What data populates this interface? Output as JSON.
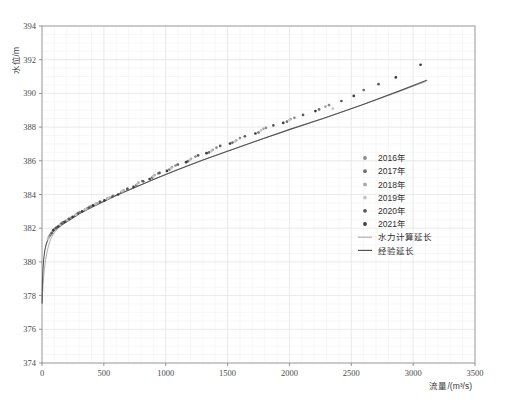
{
  "chart_data": {
    "type": "scatter",
    "title": "",
    "xlabel": "流量/(m³/s)",
    "ylabel": "水位/m",
    "xlim": [
      0,
      3500
    ],
    "ylim": [
      374,
      394
    ],
    "xticks": [
      0,
      500,
      1000,
      1500,
      2000,
      2500,
      3000,
      3500
    ],
    "yticks": [
      374,
      376,
      378,
      380,
      382,
      384,
      386,
      388,
      390,
      392,
      394
    ],
    "xtick_labels": [
      "0",
      "500",
      "1000",
      "1500",
      "2000",
      "2500",
      "3000",
      "3500"
    ],
    "ytick_labels": [
      "374",
      "376",
      "378",
      "380",
      "382",
      "384",
      "386",
      "388",
      "390",
      "392",
      "394"
    ],
    "x_minor_step": 100,
    "y_minor_step": 0.5,
    "grid": true,
    "grid_color": "#e2e2e2",
    "legend_position": "center-right",
    "series": [
      {
        "name": "2016年",
        "marker": "circle",
        "color": "#8c8c8c",
        "points": [
          [
            62,
            381.55
          ],
          [
            88,
            381.85
          ],
          [
            120,
            382.05
          ],
          [
            168,
            382.35
          ],
          [
            236,
            382.62
          ],
          [
            305,
            382.95
          ],
          [
            392,
            383.3
          ],
          [
            470,
            383.58
          ],
          [
            575,
            383.92
          ],
          [
            690,
            384.35
          ],
          [
            810,
            384.8
          ],
          [
            940,
            385.25
          ],
          [
            1080,
            385.72
          ],
          [
            1240,
            386.25
          ],
          [
            1410,
            386.78
          ],
          [
            1600,
            387.35
          ],
          [
            1810,
            387.95
          ],
          [
            2040,
            388.55
          ],
          [
            2320,
            389.3
          ]
        ]
      },
      {
        "name": "2017年",
        "marker": "circle",
        "color": "#6f6f6f",
        "points": [
          [
            70,
            381.62
          ],
          [
            102,
            381.95
          ],
          [
            145,
            382.18
          ],
          [
            198,
            382.45
          ],
          [
            268,
            382.75
          ],
          [
            348,
            383.1
          ],
          [
            435,
            383.45
          ],
          [
            528,
            383.75
          ],
          [
            640,
            384.12
          ],
          [
            762,
            384.55
          ],
          [
            890,
            385.0
          ],
          [
            1030,
            385.48
          ],
          [
            1180,
            385.98
          ],
          [
            1350,
            386.5
          ],
          [
            1540,
            387.08
          ],
          [
            1750,
            387.68
          ],
          [
            1980,
            388.32
          ],
          [
            2240,
            389.05
          ],
          [
            2600,
            390.2
          ]
        ]
      },
      {
        "name": "2018年",
        "marker": "circle",
        "color": "#a8a8a8",
        "points": [
          [
            55,
            381.45
          ],
          [
            80,
            381.75
          ],
          [
            112,
            381.98
          ],
          [
            155,
            382.25
          ],
          [
            212,
            382.52
          ],
          [
            282,
            382.85
          ],
          [
            365,
            383.18
          ],
          [
            448,
            383.48
          ],
          [
            548,
            383.82
          ],
          [
            660,
            384.25
          ],
          [
            780,
            384.7
          ],
          [
            910,
            385.15
          ],
          [
            1050,
            385.62
          ],
          [
            1205,
            386.12
          ],
          [
            1380,
            386.65
          ],
          [
            1570,
            387.22
          ],
          [
            1790,
            387.9
          ],
          [
            2010,
            388.48
          ],
          [
            2290,
            389.22
          ]
        ]
      },
      {
        "name": "2019年",
        "marker": "circle",
        "color": "#c4c4c4",
        "points": [
          [
            48,
            381.35
          ],
          [
            74,
            381.68
          ],
          [
            106,
            381.92
          ],
          [
            148,
            382.2
          ],
          [
            204,
            382.48
          ],
          [
            272,
            382.8
          ],
          [
            352,
            383.12
          ],
          [
            432,
            383.42
          ],
          [
            530,
            383.76
          ],
          [
            645,
            384.18
          ],
          [
            768,
            384.62
          ],
          [
            898,
            385.08
          ],
          [
            1040,
            385.55
          ],
          [
            1195,
            386.05
          ],
          [
            1370,
            386.58
          ],
          [
            1560,
            387.15
          ],
          [
            1770,
            387.8
          ],
          [
            2000,
            388.42
          ],
          [
            2350,
            389.1
          ]
        ]
      },
      {
        "name": "2020年",
        "marker": "circle",
        "color": "#5a5a5a",
        "points": [
          [
            78,
            381.7
          ],
          [
            112,
            382.0
          ],
          [
            158,
            382.28
          ],
          [
            218,
            382.55
          ],
          [
            292,
            382.88
          ],
          [
            378,
            383.22
          ],
          [
            468,
            383.55
          ],
          [
            570,
            383.88
          ],
          [
            690,
            384.32
          ],
          [
            818,
            384.78
          ],
          [
            950,
            385.28
          ],
          [
            1098,
            385.78
          ],
          [
            1262,
            386.32
          ],
          [
            1440,
            386.88
          ],
          [
            1640,
            387.45
          ],
          [
            1870,
            388.1
          ],
          [
            2110,
            388.72
          ],
          [
            2420,
            389.55
          ],
          [
            2720,
            390.55
          ]
        ]
      },
      {
        "name": "2021年",
        "marker": "circle",
        "color": "#3c3c3c",
        "points": [
          [
            92,
            381.88
          ],
          [
            130,
            382.1
          ],
          [
            182,
            382.38
          ],
          [
            248,
            382.68
          ],
          [
            325,
            383.0
          ],
          [
            412,
            383.35
          ],
          [
            505,
            383.65
          ],
          [
            615,
            384.0
          ],
          [
            740,
            384.45
          ],
          [
            870,
            384.92
          ],
          [
            1010,
            385.4
          ],
          [
            1165,
            385.92
          ],
          [
            1330,
            386.45
          ],
          [
            1520,
            387.02
          ],
          [
            1725,
            387.62
          ],
          [
            1950,
            388.25
          ],
          [
            2210,
            388.95
          ],
          [
            2520,
            389.85
          ],
          [
            2860,
            390.95
          ],
          [
            3060,
            391.7
          ]
        ]
      }
    ],
    "lines": [
      {
        "name": "水力计算延长",
        "color": "#b0b0b0",
        "width": 1.0,
        "points": [
          [
            2,
            377.6
          ],
          [
            6,
            378.3
          ],
          [
            12,
            379.0
          ],
          [
            20,
            379.6
          ],
          [
            30,
            380.15
          ],
          [
            44,
            380.7
          ],
          [
            60,
            381.15
          ],
          [
            80,
            381.5
          ],
          [
            105,
            381.8
          ],
          [
            140,
            382.05
          ],
          [
            185,
            382.3
          ],
          [
            240,
            382.58
          ],
          [
            310,
            382.9
          ],
          [
            400,
            383.25
          ],
          [
            500,
            383.6
          ],
          [
            620,
            384.0
          ],
          [
            760,
            384.45
          ],
          [
            920,
            384.95
          ],
          [
            1100,
            385.48
          ],
          [
            1300,
            386.05
          ],
          [
            1520,
            386.62
          ],
          [
            1760,
            387.25
          ],
          [
            2020,
            387.9
          ],
          [
            2300,
            388.58
          ],
          [
            2600,
            389.35
          ],
          [
            2900,
            390.15
          ],
          [
            3100,
            390.7
          ]
        ]
      },
      {
        "name": "经验延长",
        "color": "#555555",
        "width": 1.1,
        "points": [
          [
            1,
            377.55
          ],
          [
            3,
            378.6
          ],
          [
            7,
            379.45
          ],
          [
            13,
            380.1
          ],
          [
            22,
            380.65
          ],
          [
            34,
            381.05
          ],
          [
            50,
            381.38
          ],
          [
            70,
            381.62
          ],
          [
            95,
            381.85
          ],
          [
            130,
            382.05
          ],
          [
            175,
            382.28
          ],
          [
            230,
            382.52
          ],
          [
            300,
            382.85
          ],
          [
            390,
            383.2
          ],
          [
            490,
            383.55
          ],
          [
            610,
            383.98
          ],
          [
            750,
            384.42
          ],
          [
            910,
            384.92
          ],
          [
            1090,
            385.45
          ],
          [
            1290,
            386.02
          ],
          [
            1510,
            386.6
          ],
          [
            1750,
            387.22
          ],
          [
            2010,
            387.88
          ],
          [
            2290,
            388.56
          ],
          [
            2590,
            389.33
          ],
          [
            2890,
            390.15
          ],
          [
            3110,
            390.78
          ]
        ]
      }
    ],
    "legend_entries": [
      {
        "label": "2016年",
        "type": "marker",
        "color": "#8c8c8c"
      },
      {
        "label": "2017年",
        "type": "marker",
        "color": "#6f6f6f"
      },
      {
        "label": "2018年",
        "type": "marker",
        "color": "#a8a8a8"
      },
      {
        "label": "2019年",
        "type": "marker",
        "color": "#c4c4c4"
      },
      {
        "label": "2020年",
        "type": "marker",
        "color": "#5a5a5a"
      },
      {
        "label": "2021年",
        "type": "marker",
        "color": "#3c3c3c"
      },
      {
        "label": "水力计算延长",
        "type": "line",
        "color": "#b0b0b0"
      },
      {
        "label": "经验延长",
        "type": "line",
        "color": "#555555"
      }
    ]
  },
  "axes": {
    "x_title": "流量/(m³/s)",
    "y_title": "水位/m"
  }
}
